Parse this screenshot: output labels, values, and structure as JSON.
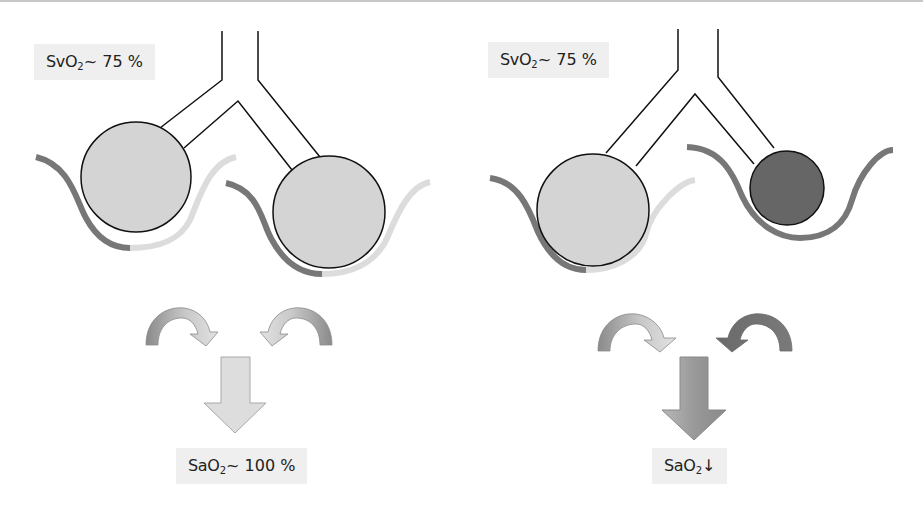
{
  "panels": [
    {
      "id": "left",
      "venous_label": {
        "prefix": "SvO",
        "sub": "2",
        "suffix": "~ 75 %"
      },
      "arterial_label": {
        "prefix": "SaO",
        "sub": "2",
        "suffix": "~ 100 %"
      },
      "alveoli": [
        {
          "name": "left-alveolus",
          "state": "ventilated",
          "fill": "#d4d4d4"
        },
        {
          "name": "right-alveolus",
          "state": "ventilated",
          "fill": "#d4d4d4"
        }
      ],
      "capillaries": [
        {
          "name": "left-capillary",
          "start_color": "#777777",
          "end_color": "#dcdcdc"
        },
        {
          "name": "right-capillary",
          "start_color": "#777777",
          "end_color": "#dcdcdc"
        }
      ],
      "mixing_arrows": [
        {
          "name": "left-curved-arrow",
          "colors": [
            "#8a8a8a",
            "#dedede"
          ]
        },
        {
          "name": "right-curved-arrow",
          "colors": [
            "#8a8a8a",
            "#dedede"
          ]
        }
      ],
      "result_arrow": {
        "color": "#dddddd"
      }
    },
    {
      "id": "right",
      "venous_label": {
        "prefix": "SvO",
        "sub": "2",
        "suffix": "~ 75 %"
      },
      "arterial_label": {
        "prefix": "SaO",
        "sub": "2",
        "suffix": "↓"
      },
      "alveoli": [
        {
          "name": "left-alveolus",
          "state": "ventilated",
          "fill": "#d4d4d4"
        },
        {
          "name": "right-alveolus",
          "state": "collapsed-shunt",
          "fill": "#666666"
        }
      ],
      "capillaries": [
        {
          "name": "left-capillary",
          "start_color": "#777777",
          "end_color": "#dcdcdc"
        },
        {
          "name": "right-capillary",
          "start_color": "#777777",
          "end_color": "#777777"
        }
      ],
      "mixing_arrows": [
        {
          "name": "left-curved-arrow",
          "colors": [
            "#8a8a8a",
            "#dedede"
          ]
        },
        {
          "name": "right-curved-arrow",
          "colors": [
            "#6e6e6e",
            "#6e6e6e"
          ]
        }
      ],
      "result_arrow": {
        "color": "#9a9a9a"
      }
    }
  ],
  "colors": {
    "outline": "#111111",
    "alveolus_normal": "#d4d4d4",
    "alveolus_shunt": "#666666",
    "deoxygenated": "#777777",
    "oxygenated": "#dcdcdc",
    "label_bg": "#efefef"
  }
}
